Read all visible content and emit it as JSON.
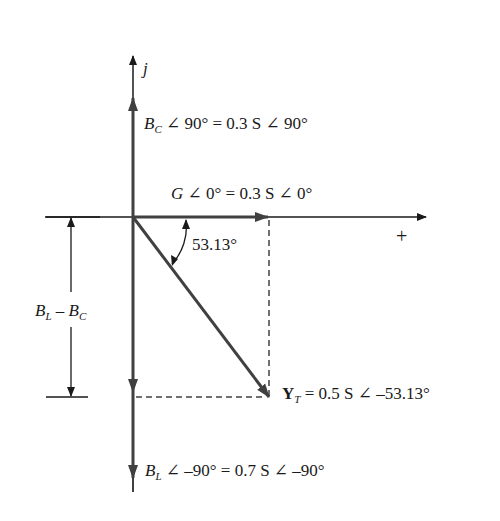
{
  "diagram": {
    "type": "phasor-diagram",
    "axes": {
      "vertical_label": "j",
      "horizontal_label": "+"
    },
    "phasors": {
      "bc": {
        "symbol": "B",
        "sub": "C",
        "rest": " ∠ 90°  =  0.3 S ∠ 90°"
      },
      "g": {
        "symbol": "G",
        "rest": " ∠ 0°  =  0.3 S ∠ 0°"
      },
      "yt": {
        "symbol": "Y",
        "sub": "T",
        "rest": " =  0.5 S ∠ –53.13°"
      },
      "bl": {
        "symbol": "B",
        "sub": "L",
        "rest": " ∠ –90°  =  0.7 S ∠ –90°"
      }
    },
    "angle_label": "53.13°",
    "dimension": {
      "a": "B",
      "a_sub": "L",
      "mid": " – ",
      "b": "B",
      "b_sub": "C"
    },
    "colors": {
      "line": "#1a1a1a",
      "phasor": "#404040"
    }
  }
}
